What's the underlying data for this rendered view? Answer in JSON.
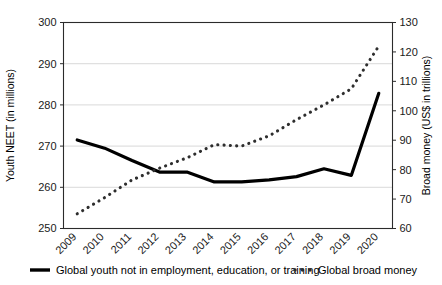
{
  "chart_data": {
    "type": "line",
    "title": "",
    "xlabel": "",
    "categories": [
      "2009",
      "2010",
      "2011",
      "2012",
      "2013",
      "2014",
      "2015",
      "2016",
      "2017",
      "2018",
      "2019",
      "2020"
    ],
    "axes": {
      "left": {
        "label": "Youth NEET (in millions)",
        "ylim": [
          250,
          300
        ],
        "ticks": [
          250,
          260,
          270,
          280,
          290,
          300
        ],
        "tick_labels": [
          "250",
          "260",
          "270",
          "280",
          "290",
          "300"
        ]
      },
      "right": {
        "label": "Broad money (US$ in trillions)",
        "ylim": [
          60,
          130
        ],
        "ticks": [
          60,
          70,
          80,
          90,
          100,
          110,
          120,
          130
        ],
        "tick_labels": [
          "60",
          "70",
          "80",
          "90",
          "100",
          "110",
          "120",
          "130"
        ]
      }
    },
    "grid": true,
    "legend_position": "bottom",
    "series": [
      {
        "name": "Global youth not in employment, education, or training",
        "axis": "left",
        "style": "solid",
        "color": "#000000",
        "values": [
          271.5,
          269.5,
          266.5,
          263.7,
          263.7,
          261.3,
          261.3,
          261.8,
          262.6,
          264.5,
          262.9,
          282.8
        ]
      },
      {
        "name": "Global broad money",
        "axis": "right",
        "style": "dotted",
        "color": "#2e2e2e",
        "values": [
          65.0,
          70.5,
          76.5,
          80.5,
          84.0,
          88.5,
          88.0,
          91.5,
          97.0,
          102.0,
          107.5,
          122.0
        ]
      }
    ],
    "legend": [
      {
        "label": "Global youth not in employment, education, or training",
        "marker": "solid-line",
        "color": "#000000"
      },
      {
        "label": "Global broad money",
        "marker": "dotted-line",
        "color": "#2e2e2e"
      }
    ]
  }
}
